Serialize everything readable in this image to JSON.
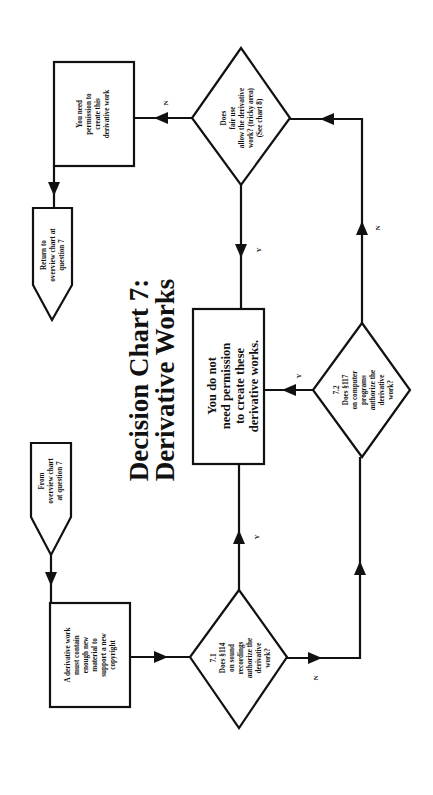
{
  "title": {
    "line1": "Decision Chart 7:",
    "line2": "Derivative Works"
  },
  "nodes": {
    "from_overview": {
      "lines": [
        "From",
        "overview chart",
        "at question 7"
      ]
    },
    "enough_new_material": {
      "lines": [
        "A derivative work",
        "must contain",
        "enough new",
        "material to",
        "support a new",
        "copyright"
      ]
    },
    "q7_1": {
      "lines": [
        "7.1",
        "Does §114",
        "on sound",
        "recordings",
        "authorize the",
        "derivative",
        "work?"
      ]
    },
    "q7_2": {
      "lines": [
        "7.2",
        "Does §117",
        "on computer",
        "programs",
        "authorize the",
        "derivative",
        "work?"
      ]
    },
    "no_permission_needed": {
      "lines": [
        "You do not",
        "need permission",
        "to create these",
        "derivative works."
      ]
    },
    "fair_use": {
      "lines": [
        "Does",
        "fair use",
        "allow the derivative",
        "work? (tricky area)",
        "(See chart 8)"
      ]
    },
    "need_permission": {
      "lines": [
        "You need",
        "permission to",
        "create  this",
        "derivative work"
      ]
    },
    "return_overview": {
      "lines": [
        "Return to",
        "overview chart at",
        "question 7"
      ]
    }
  },
  "edge_labels": {
    "q71_yes": "Y",
    "q71_no": "N",
    "q72_yes": "Y",
    "q72_no": "N",
    "fair_yes": "Y",
    "fair_no": "N"
  },
  "colors": {
    "ink": "#111111",
    "background": "#ffffff"
  }
}
